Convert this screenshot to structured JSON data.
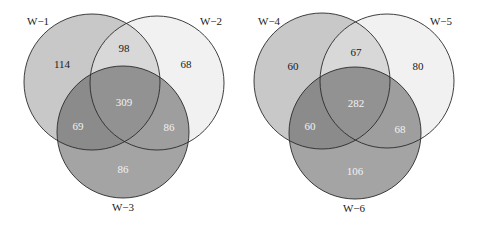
{
  "diagrams": [
    {
      "id": "venn-left",
      "sets": [
        {
          "label": "W−1",
          "cx": 92,
          "cy": 82,
          "r": 68,
          "fill": "#9a9a9a",
          "label_x": 27,
          "label_y": 25,
          "label_anchor": "start"
        },
        {
          "label": "W−2",
          "cx": 157,
          "cy": 83,
          "r": 67,
          "fill": "#e6e6e6",
          "label_x": 222,
          "label_y": 25,
          "label_anchor": "end"
        },
        {
          "label": "W−3",
          "cx": 123,
          "cy": 132,
          "r": 66,
          "fill": "#5a5a5a",
          "label_x": 123,
          "label_y": 211,
          "label_anchor": "middle"
        }
      ],
      "regions": [
        {
          "name": "only-1",
          "value": "114",
          "x": 62,
          "y": 65,
          "color": "#1a1a1a"
        },
        {
          "name": "1-2",
          "value": "98",
          "x": 124,
          "y": 49,
          "color": "#1a1a1a"
        },
        {
          "name": "only-2",
          "value": "68",
          "x": 186,
          "y": 65,
          "color": "#1a1a1a"
        },
        {
          "name": "1-2-3",
          "value": "309",
          "x": 124,
          "y": 103,
          "color": "#f2f2f2"
        },
        {
          "name": "1-3",
          "value": "69",
          "x": 78,
          "y": 127,
          "color": "#f2f2f2"
        },
        {
          "name": "2-3",
          "value": "86",
          "x": 169,
          "y": 128,
          "color": "#f2f2f2"
        },
        {
          "name": "only-3",
          "value": "86",
          "x": 123,
          "y": 170,
          "color": "#f2f2f2"
        }
      ]
    },
    {
      "id": "venn-right",
      "sets": [
        {
          "label": "W−4",
          "cx": 322,
          "cy": 81,
          "r": 68,
          "fill": "#9a9a9a",
          "label_x": 258,
          "label_y": 25,
          "label_anchor": "start"
        },
        {
          "label": "W−5",
          "cx": 387,
          "cy": 81,
          "r": 67,
          "fill": "#e6e6e6",
          "label_x": 452,
          "label_y": 25,
          "label_anchor": "end"
        },
        {
          "label": "W−6",
          "cx": 355,
          "cy": 133,
          "r": 66,
          "fill": "#5a5a5a",
          "label_x": 354,
          "label_y": 212,
          "label_anchor": "middle"
        }
      ],
      "regions": [
        {
          "name": "only-4",
          "value": "60",
          "x": 293,
          "y": 67,
          "color": "#1a1a1a"
        },
        {
          "name": "4-5",
          "value": "67",
          "x": 356,
          "y": 53,
          "color": "#1a1a1a"
        },
        {
          "name": "only-5",
          "value": "80",
          "x": 418,
          "y": 67,
          "color": "#1a1a1a"
        },
        {
          "name": "4-5-6",
          "value": "282",
          "x": 356,
          "y": 104,
          "color": "#f2f2f2"
        },
        {
          "name": "4-6",
          "value": "60",
          "x": 310,
          "y": 127,
          "color": "#f2f2f2"
        },
        {
          "name": "5-6",
          "value": "68",
          "x": 400,
          "y": 130,
          "color": "#f2f2f2"
        },
        {
          "name": "only-6",
          "value": "106",
          "x": 355,
          "y": 172,
          "color": "#f2f2f2"
        }
      ]
    }
  ],
  "style": {
    "stroke": "#2a2a2a",
    "label_color": "#222222",
    "fill_opacity": 0.55
  }
}
